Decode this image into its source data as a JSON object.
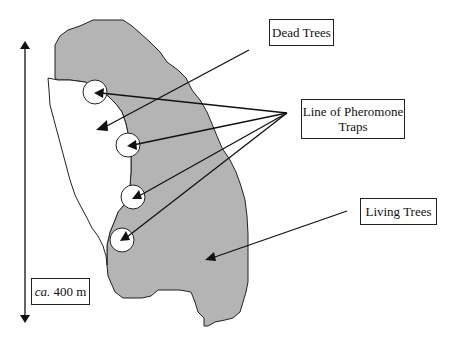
{
  "diagram": {
    "labels": {
      "dead_trees": "Dead Trees",
      "pheromone_line1": "Line of Pheromone",
      "pheromone_line2": "Traps",
      "living_trees": "Living Trees",
      "scale_prefix": "ca.",
      "scale_value": " 400 m"
    },
    "colors": {
      "living_fill": "#b4b4b4",
      "dead_fill": "#ffffff",
      "outline": "#222222"
    },
    "traps": [
      {
        "cx": 97,
        "cy": 92
      },
      {
        "cx": 127,
        "cy": 145
      },
      {
        "cx": 133,
        "cy": 198
      },
      {
        "cx": 122,
        "cy": 240
      }
    ]
  }
}
